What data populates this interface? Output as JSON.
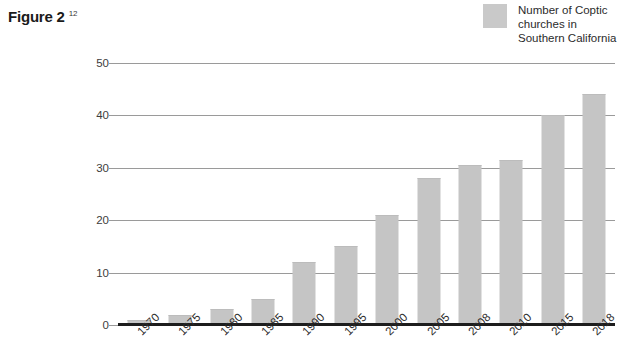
{
  "figure": {
    "caption": "Figure 2",
    "footnote_marker": "12"
  },
  "legend": {
    "position": "top-right",
    "entries": [
      {
        "label": "Number of Coptic churches in Southern California",
        "color": "#c9c9c9",
        "swatch_name": "legend-swatch"
      }
    ]
  },
  "colors": {
    "bar": "#c5c5c5",
    "gridline": "#9a9a9a",
    "axis": "#1d1d1d",
    "text": "#2b2b2b",
    "background": "#ffffff"
  },
  "chart_data": {
    "type": "bar",
    "title": "Figure 2",
    "xlabel": "",
    "ylabel": "",
    "categories": [
      "1970",
      "1975",
      "1980",
      "1985",
      "1990",
      "1995",
      "2000",
      "2005",
      "2008",
      "2010",
      "2015",
      "2018"
    ],
    "values": [
      1,
      2,
      3,
      5,
      12,
      15,
      21,
      28,
      30.5,
      31.5,
      40,
      44
    ],
    "series": [
      {
        "name": "Number of Coptic churches in Southern California",
        "values": [
          1,
          2,
          3,
          5,
          12,
          15,
          21,
          28,
          30.5,
          31.5,
          40,
          44
        ],
        "color": "#c5c5c5"
      }
    ],
    "ylim": [
      0,
      50
    ],
    "yticks": [
      0,
      10,
      20,
      30,
      40,
      50
    ],
    "ytick_labels": [
      "0",
      "10",
      "20",
      "30",
      "40",
      "50"
    ],
    "grid": true,
    "grid_axis": "y",
    "legend_position": "top-right",
    "xtick_rotation": -45
  }
}
